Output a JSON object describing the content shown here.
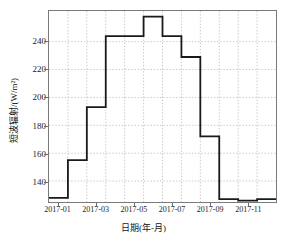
{
  "chart_data": {
    "type": "line",
    "line_style": "step-post",
    "title": "",
    "xlabel": "日期(年-月)",
    "ylabel": "短波辐射/(W/m²)",
    "grid": true,
    "grid_style": "dotted",
    "legend": null,
    "categories": [
      "2017-01",
      "2017-02",
      "2017-03",
      "2017-04",
      "2017-05",
      "2017-06",
      "2017-07",
      "2017-08",
      "2017-09",
      "2017-10",
      "2017-11",
      "2017-12"
    ],
    "x_tick_labels": [
      "2017-01",
      "2017-03",
      "2017-05",
      "2017-07",
      "2017-09",
      "2017-11"
    ],
    "y_tick_labels": [
      "140",
      "160",
      "180",
      "200",
      "220",
      "240"
    ],
    "y_ticks": [
      140,
      160,
      180,
      200,
      220,
      240
    ],
    "ylim": [
      125,
      262
    ],
    "values": [
      128,
      155,
      193,
      244,
      244,
      258,
      244,
      229,
      172,
      127,
      126,
      127
    ],
    "series": [
      {
        "name": "短波辐射",
        "values": [
          128,
          155,
          193,
          244,
          244,
          258,
          244,
          229,
          172,
          127,
          126,
          127
        ],
        "color": "#1a1a1a"
      }
    ]
  },
  "axes": {
    "x_title": "日期(年-月)",
    "y_title": "短波辐射/(W/m²)",
    "y_ticks": [
      {
        "label": "240",
        "value": 240
      },
      {
        "label": "220",
        "value": 220
      },
      {
        "label": "200",
        "value": 200
      },
      {
        "label": "180",
        "value": 180
      },
      {
        "label": "160",
        "value": 160
      },
      {
        "label": "140",
        "value": 140
      }
    ],
    "x_ticks": [
      {
        "label": "2017-01",
        "index": 0
      },
      {
        "label": "2017-03",
        "index": 2
      },
      {
        "label": "2017-05",
        "index": 4
      },
      {
        "label": "2017-07",
        "index": 6
      },
      {
        "label": "2017-09",
        "index": 8
      },
      {
        "label": "2017-11",
        "index": 10
      }
    ]
  },
  "style": {
    "line_color": "#1a1a1a",
    "grid_color": "#b9b9b9",
    "frame_color": "#7a7a7a",
    "background": "#ffffff"
  }
}
